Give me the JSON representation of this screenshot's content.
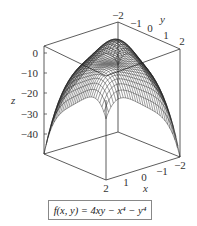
{
  "chart_data": {
    "type": "surface3d",
    "title": "",
    "function": "f(x, y) = 4xy − x⁴ − y⁴",
    "xlabel": "x",
    "ylabel": "y",
    "zlabel": "z",
    "x_ticks": [
      "2",
      "1",
      "0",
      "−1",
      "−2"
    ],
    "y_ticks": [
      "−2",
      "−1",
      "0",
      "1",
      "2"
    ],
    "z_ticks": [
      "0",
      "−10",
      "−20",
      "−30",
      "−40"
    ],
    "xlim": [
      -2,
      2
    ],
    "ylim": [
      -2,
      2
    ],
    "zlim": [
      -48,
      5
    ],
    "style": "wireframe mesh",
    "grid": false
  },
  "labels": {
    "x": "x",
    "y": "y",
    "z": "z",
    "formula": "f(x, y) = 4xy − x⁴ − y⁴"
  }
}
